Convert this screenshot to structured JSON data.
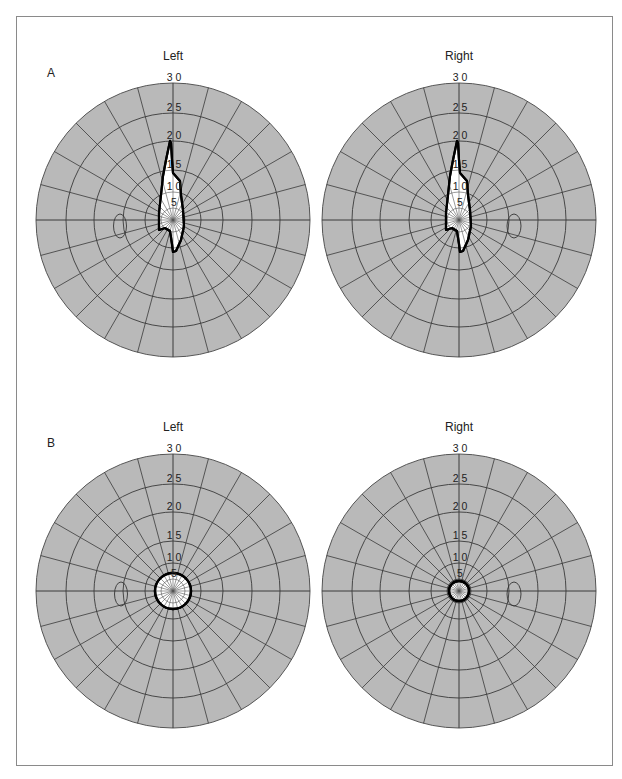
{
  "figure": {
    "panels": [
      {
        "letter": "A",
        "letter_pos": [
          47,
          73
        ],
        "fields": [
          {
            "eye": "Left",
            "cx": 173,
            "cy": 220,
            "label_y": 56,
            "blind_spot": {
              "cx": 120,
              "cy": 226,
              "rx": 6.5,
              "ry": 12
            },
            "defect": {
              "type": "polygon",
              "points": "170,141 166,160 163,176 161,195 159,213 159,230 165,228 170,231 172,244 173,252 176,251 181,240 184,226 183,210 181,195 180,181 173,173 172,160 171,143"
            }
          },
          {
            "eye": "Right",
            "cx": 459,
            "cy": 220,
            "label_y": 56,
            "blind_spot": {
              "cx": 514,
              "cy": 226,
              "rx": 7,
              "ry": 12
            },
            "defect": {
              "type": "polygon",
              "points": "457,141 453,160 450,176 448,195 446,213 446,230 452,228 457,231 459,244 460,252 463,251 468,240 471,226 470,210 468,195 467,181 460,173 459,160 458,143"
            }
          }
        ]
      },
      {
        "letter": "B",
        "letter_pos": [
          47,
          443
        ],
        "fields": [
          {
            "eye": "Left",
            "cx": 173,
            "cy": 591,
            "label_y": 427,
            "blind_spot": {
              "cx": 121,
              "cy": 594,
              "rx": 6.5,
              "ry": 12
            },
            "defect": {
              "type": "circle",
              "r": 18
            }
          },
          {
            "eye": "Right",
            "cx": 459,
            "cy": 591,
            "label_y": 427,
            "blind_spot": {
              "cx": 514,
              "cy": 594,
              "rx": 7,
              "ry": 12
            },
            "defect": {
              "type": "circle",
              "r": 10
            }
          }
        ]
      }
    ],
    "grid": {
      "ring_labels": [
        "3 0",
        "2 5",
        "2 0",
        "1 5",
        "1 0",
        "5"
      ],
      "ring_degrees": [
        30,
        25,
        20,
        15,
        10,
        5
      ],
      "ring_radii_px": [
        137,
        107,
        79,
        50,
        28,
        12
      ],
      "spoke_step_deg": 15,
      "fill_color": "#b9b9b9",
      "line_color": "#3a3a3a",
      "defect_fill": "#ffffff",
      "defect_stroke": "#000000"
    }
  }
}
